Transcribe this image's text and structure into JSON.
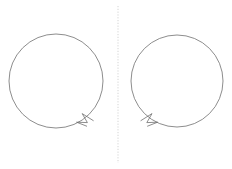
{
  "figure": {
    "title": "",
    "background_color": "#ffffff",
    "width": 232,
    "height": 169,
    "stroke_color": "#707070",
    "stroke_width": 0.8,
    "mirror_line_color": "#cfcfcf"
  },
  "mirror_line": {
    "name": "vertical-dotted-mirror-line",
    "x": 118,
    "y_start": 6,
    "y_end": 163,
    "dash_pattern": "1.2 1.6",
    "color": "#cfcfcf",
    "width": 0.9
  },
  "shapes": [
    {
      "id": "left-circle",
      "label": "Clockwise oriented circle",
      "direction": "clockwise",
      "cx": 56,
      "cy": 81,
      "r": 47,
      "color": "#707070",
      "arrow": {
        "label": "clockwise-arrowhead",
        "angle_deg": 55,
        "tip_x": 93,
        "tip_y": 120,
        "points": "93.6,120.8 82.2,113.6 87.4,122.6 76.6,122.2 87.0,126.3"
      }
    },
    {
      "id": "right-circle",
      "label": "Counter-clockwise oriented circle",
      "direction": "counter-clockwise",
      "cx": 177,
      "cy": 81,
      "r": 46,
      "color": "#707070",
      "arrow": {
        "label": "counter-clockwise-arrowhead",
        "angle_deg": 125,
        "tip_x": 141,
        "tip_y": 120,
        "points": "140.6,120.8 152.0,113.6 146.8,122.6 157.6,122.2 147.2,126.3"
      }
    }
  ],
  "annotations": []
}
